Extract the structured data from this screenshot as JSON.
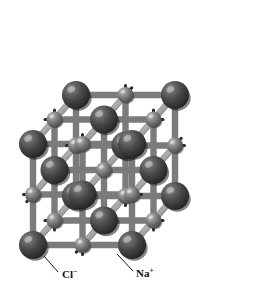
{
  "figure": {
    "kind": "ball-and-stick-crystal-lattice",
    "background_color": "#ffffff",
    "projection": "oblique",
    "grid": {
      "nx": 3,
      "ny": 3,
      "nz": 3
    },
    "front_origin": {
      "x": 33,
      "y": 245
    },
    "step_x": 49.5,
    "step_y": 50.5,
    "depth_offset": {
      "dx": 21.5,
      "dy": -24.5
    }
  },
  "species": {
    "chloride": {
      "symbol": "Cl",
      "charge": "−",
      "label": "Cl⁻",
      "role": "anion",
      "radius_px": 14,
      "color": "#3f3f3f",
      "highlight_color": "#8d8d8d",
      "shadow_color": "#1d1d1d"
    },
    "sodium": {
      "symbol": "Na",
      "charge": "+",
      "label": "Na⁺",
      "role": "cation",
      "radius_px": 8,
      "color": "#6e6e6e",
      "highlight_color": "#c2c2c2",
      "shadow_color": "#3c3c3c"
    }
  },
  "bonds": {
    "color": "#a8a8a8",
    "edge_color": "#7b7b7b",
    "highlight_color": "#cfcfcf",
    "width_px": 5,
    "stub_color": "#2a2a2a",
    "stub_width_px": 3
  },
  "labels": [
    {
      "id": "label-chloride",
      "text": "Cl",
      "superscript": "−",
      "x": 62,
      "y": 278,
      "leader": {
        "x1": 58,
        "y1": 272,
        "x2": 44,
        "y2": 256
      }
    },
    {
      "id": "label-sodium",
      "text": "Na",
      "superscript": "+",
      "x": 136,
      "y": 277,
      "leader": {
        "x1": 133,
        "y1": 271,
        "x2": 117,
        "y2": 254
      }
    }
  ],
  "colors": {
    "accent": "#3f3f3f",
    "secondary": "#6e6e6e",
    "rod": "#a8a8a8"
  }
}
